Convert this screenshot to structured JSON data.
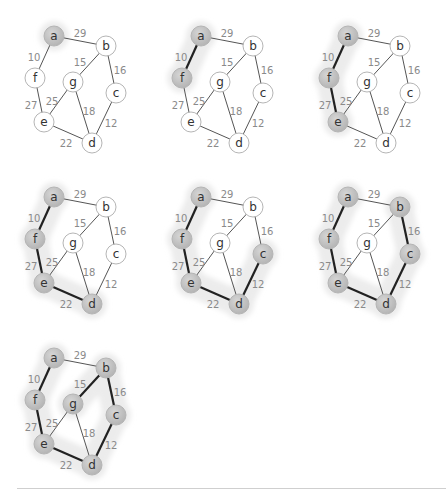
{
  "colors": {
    "node_fill": "#ffffff",
    "visited_fill": "#c4c4c4",
    "halo": "#ececec",
    "edge": "#555555",
    "tree_edge": "#222222",
    "weight_label": "#8a8a8a"
  },
  "graph": {
    "nodes": [
      {
        "id": "a",
        "x": 54,
        "y": 36
      },
      {
        "id": "b",
        "x": 106,
        "y": 46
      },
      {
        "id": "f",
        "x": 35,
        "y": 78
      },
      {
        "id": "g",
        "x": 73,
        "y": 82
      },
      {
        "id": "c",
        "x": 116,
        "y": 93
      },
      {
        "id": "e",
        "x": 44,
        "y": 122
      },
      {
        "id": "d",
        "x": 92,
        "y": 143
      }
    ],
    "edges": [
      {
        "from": "a",
        "to": "b",
        "w": "29",
        "lx": 80,
        "ly": 33
      },
      {
        "from": "a",
        "to": "f",
        "w": "10",
        "lx": 34,
        "ly": 57
      },
      {
        "from": "b",
        "to": "g",
        "w": "15",
        "lx": 80,
        "ly": 62
      },
      {
        "from": "b",
        "to": "c",
        "w": "16",
        "lx": 120,
        "ly": 70
      },
      {
        "from": "f",
        "to": "e",
        "w": "27",
        "lx": 31,
        "ly": 105
      },
      {
        "from": "g",
        "to": "e",
        "w": "25",
        "lx": 52,
        "ly": 101
      },
      {
        "from": "g",
        "to": "d",
        "w": "18",
        "lx": 89,
        "ly": 111
      },
      {
        "from": "c",
        "to": "d",
        "w": "12",
        "lx": 111,
        "ly": 123
      },
      {
        "from": "e",
        "to": "d",
        "w": "22",
        "lx": 66,
        "ly": 143
      }
    ]
  },
  "steps": [
    {
      "ox": 0,
      "oy": 0,
      "visited": [
        "a"
      ],
      "tree": []
    },
    {
      "ox": 147,
      "oy": 0,
      "visited": [
        "a",
        "f"
      ],
      "tree": [
        "a-f"
      ]
    },
    {
      "ox": 294,
      "oy": 0,
      "visited": [
        "a",
        "f",
        "e"
      ],
      "tree": [
        "a-f",
        "f-e"
      ]
    },
    {
      "ox": 0,
      "oy": 161,
      "visited": [
        "a",
        "f",
        "e",
        "d"
      ],
      "tree": [
        "a-f",
        "f-e",
        "e-d"
      ]
    },
    {
      "ox": 147,
      "oy": 161,
      "visited": [
        "a",
        "f",
        "e",
        "d",
        "c"
      ],
      "tree": [
        "a-f",
        "f-e",
        "e-d",
        "c-d"
      ]
    },
    {
      "ox": 294,
      "oy": 161,
      "visited": [
        "a",
        "f",
        "e",
        "d",
        "c",
        "b"
      ],
      "tree": [
        "a-f",
        "f-e",
        "e-d",
        "c-d",
        "b-c"
      ]
    },
    {
      "ox": 0,
      "oy": 322,
      "visited": [
        "a",
        "f",
        "e",
        "d",
        "c",
        "b",
        "g"
      ],
      "tree": [
        "a-f",
        "f-e",
        "e-d",
        "c-d",
        "b-c",
        "b-g"
      ]
    }
  ]
}
